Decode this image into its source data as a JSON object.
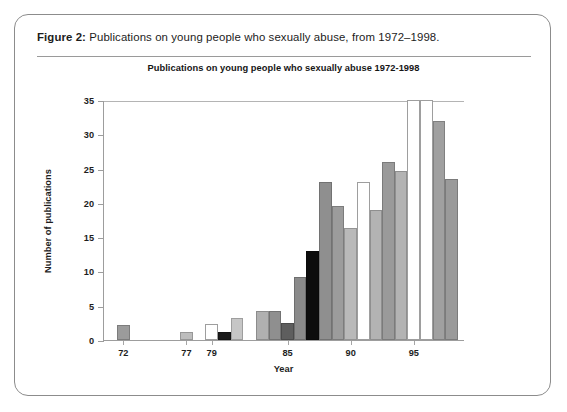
{
  "figure": {
    "caption_label": "Figure 2:",
    "caption_text": " Publications on young people who sexually abuse, from 1972–1998."
  },
  "chart_data": {
    "type": "bar",
    "title": "Publications on young people who sexually abuse 1972-1998",
    "xlabel": "Year",
    "ylabel": "Number of publications",
    "ylim": [
      0,
      35
    ],
    "yticks": [
      0,
      5,
      10,
      15,
      20,
      25,
      30,
      35
    ],
    "xticks": [
      "72",
      "77",
      "79",
      "85",
      "90",
      "95"
    ],
    "xtick_years": [
      1972,
      1977,
      1979,
      1985,
      1990,
      1995
    ],
    "grid": false,
    "legend": "none",
    "categories": [
      "1972",
      "1973",
      "1974",
      "1975",
      "1976",
      "1977",
      "1978",
      "1979",
      "1980",
      "1981",
      "1982",
      "1983",
      "1984",
      "1985",
      "1986",
      "1987",
      "1988",
      "1989",
      "1990",
      "1991",
      "1992",
      "1993",
      "1994",
      "1995",
      "1996",
      "1997",
      "1998"
    ],
    "values": [
      2.2,
      0,
      0,
      0,
      0,
      1.2,
      0,
      2.3,
      1.2,
      3.2,
      0,
      4.3,
      4.3,
      2.5,
      9.2,
      13.0,
      23.0,
      19.5,
      16.3,
      23.0,
      19.0,
      26.0,
      24.7,
      35.0,
      35.0,
      32.0,
      23.5
    ],
    "bar_colors": [
      "#9b9b9b",
      "#ffffff",
      "#ffffff",
      "#ffffff",
      "#ffffff",
      "#bdbdbd",
      "#ffffff",
      "#ffffff",
      "#1a1a1a",
      "#c6c6c6",
      "#ffffff",
      "#b0b0b0",
      "#8f8f8f",
      "#5e5e5e",
      "#8a8a8a",
      "#0d0d0d",
      "#8f8f8f",
      "#9c9c9c",
      "#b9b9b9",
      "#ffffff",
      "#b3b3b3",
      "#9a9a9a",
      "#b3b3b3",
      "#ffffff",
      "#ffffff",
      "#a0a0a0",
      "#9a9a9a"
    ]
  }
}
